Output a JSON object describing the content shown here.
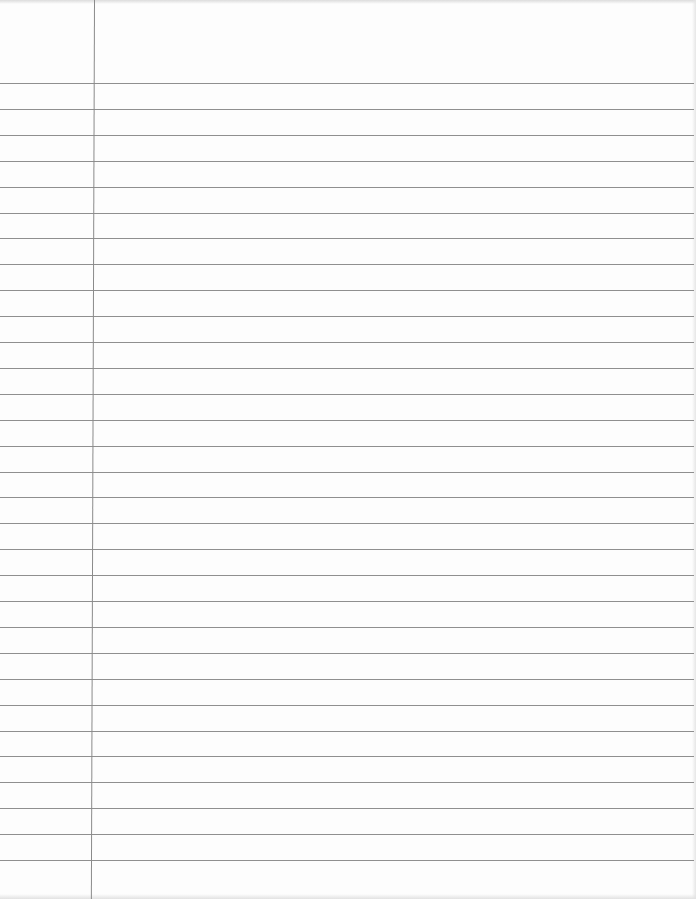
{
  "page": {
    "type": "lined-notebook-paper",
    "content_text": "",
    "background_color": "#fdfdfd",
    "line_color": "#8f8f8f",
    "margin_line_color": "#8a8a8a",
    "margin_line_x": 94,
    "first_line_y": 83,
    "line_spacing": 25.9,
    "line_count": 31
  }
}
